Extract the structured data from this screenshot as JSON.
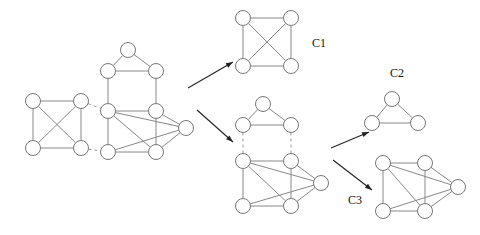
{
  "figure": {
    "title": "",
    "background_color": "#ffffff",
    "node_fill": "#ffffff",
    "node_stroke": "#777777",
    "edge_color": "#888888",
    "dashed_edge_color": "#999999",
    "arrow_color": "#222222",
    "label_color": "#111111",
    "node_radius": 7.5
  },
  "labels": {
    "c1": "C1",
    "c2": "C2",
    "c3": "C3"
  },
  "chart_data": {
    "type": "diagram",
    "graphs": [
      {
        "id": "input-graph",
        "name": "input-graph",
        "nodes": [
          {
            "id": "a1",
            "x": 33,
            "y": 101
          },
          {
            "id": "a2",
            "x": 81,
            "y": 101
          },
          {
            "id": "a3",
            "x": 33,
            "y": 148
          },
          {
            "id": "a4",
            "x": 81,
            "y": 148
          },
          {
            "id": "t1",
            "x": 128,
            "y": 50
          },
          {
            "id": "b1",
            "x": 108,
            "y": 71
          },
          {
            "id": "b2",
            "x": 156,
            "y": 71
          },
          {
            "id": "c1n",
            "x": 108,
            "y": 111
          },
          {
            "id": "c2n",
            "x": 156,
            "y": 111
          },
          {
            "id": "c3n",
            "x": 108,
            "y": 152
          },
          {
            "id": "c4n",
            "x": 156,
            "y": 152
          },
          {
            "id": "c5n",
            "x": 186,
            "y": 128
          }
        ],
        "solid_edges": [
          [
            "a1",
            "a2"
          ],
          [
            "a1",
            "a3"
          ],
          [
            "a2",
            "a4"
          ],
          [
            "a3",
            "a4"
          ],
          [
            "a1",
            "a4"
          ],
          [
            "a2",
            "a3"
          ],
          [
            "t1",
            "b1"
          ],
          [
            "t1",
            "b2"
          ],
          [
            "b1",
            "b2"
          ],
          [
            "b1",
            "c1n"
          ],
          [
            "b2",
            "c2n"
          ],
          [
            "c1n",
            "c2n"
          ],
          [
            "c1n",
            "c3n"
          ],
          [
            "c3n",
            "c4n"
          ],
          [
            "c2n",
            "c4n"
          ],
          [
            "c1n",
            "c5n"
          ],
          [
            "c2n",
            "c5n"
          ],
          [
            "c3n",
            "c5n"
          ],
          [
            "c4n",
            "c5n"
          ],
          [
            "c1n",
            "c4n"
          ]
        ],
        "dashed_edges": [
          [
            "a2",
            "c1n"
          ],
          [
            "a4",
            "c3n"
          ]
        ]
      },
      {
        "id": "cluster-c1",
        "name": "cluster-c1-graph",
        "label": "C1",
        "nodes": [
          {
            "id": "p1",
            "x": 243,
            "y": 18
          },
          {
            "id": "p2",
            "x": 291,
            "y": 18
          },
          {
            "id": "p3",
            "x": 243,
            "y": 66
          },
          {
            "id": "p4",
            "x": 291,
            "y": 66
          }
        ],
        "solid_edges": [
          [
            "p1",
            "p2"
          ],
          [
            "p1",
            "p3"
          ],
          [
            "p2",
            "p4"
          ],
          [
            "p3",
            "p4"
          ],
          [
            "p1",
            "p4"
          ],
          [
            "p2",
            "p3"
          ]
        ],
        "dashed_edges": []
      },
      {
        "id": "intermediate-graph",
        "name": "intermediate-graph",
        "nodes": [
          {
            "id": "m0",
            "x": 263,
            "y": 104
          },
          {
            "id": "m1",
            "x": 243,
            "y": 125
          },
          {
            "id": "m2",
            "x": 291,
            "y": 125
          },
          {
            "id": "m3",
            "x": 243,
            "y": 161
          },
          {
            "id": "m4",
            "x": 291,
            "y": 161
          },
          {
            "id": "m5",
            "x": 243,
            "y": 206
          },
          {
            "id": "m6",
            "x": 291,
            "y": 206
          },
          {
            "id": "m7",
            "x": 321,
            "y": 183
          }
        ],
        "solid_edges": [
          [
            "m0",
            "m1"
          ],
          [
            "m0",
            "m2"
          ],
          [
            "m1",
            "m2"
          ],
          [
            "m3",
            "m4"
          ],
          [
            "m3",
            "m5"
          ],
          [
            "m5",
            "m6"
          ],
          [
            "m4",
            "m6"
          ],
          [
            "m3",
            "m7"
          ],
          [
            "m4",
            "m7"
          ],
          [
            "m5",
            "m7"
          ],
          [
            "m6",
            "m7"
          ],
          [
            "m3",
            "m6"
          ]
        ],
        "dashed_edges": [
          [
            "m1",
            "m3"
          ],
          [
            "m2",
            "m4"
          ]
        ]
      },
      {
        "id": "cluster-c2",
        "name": "cluster-c2-graph",
        "label": "C2",
        "nodes": [
          {
            "id": "q0",
            "x": 392,
            "y": 99
          },
          {
            "id": "q1",
            "x": 372,
            "y": 123
          },
          {
            "id": "q2",
            "x": 418,
            "y": 123
          }
        ],
        "solid_edges": [
          [
            "q0",
            "q1"
          ],
          [
            "q0",
            "q2"
          ],
          [
            "q1",
            "q2"
          ]
        ],
        "dashed_edges": []
      },
      {
        "id": "cluster-c3",
        "name": "cluster-c3-graph",
        "label": "C3",
        "nodes": [
          {
            "id": "r1",
            "x": 383,
            "y": 163
          },
          {
            "id": "r2",
            "x": 425,
            "y": 163
          },
          {
            "id": "r3",
            "x": 383,
            "y": 211
          },
          {
            "id": "r4",
            "x": 425,
            "y": 211
          },
          {
            "id": "r5",
            "x": 458,
            "y": 187
          }
        ],
        "solid_edges": [
          [
            "r1",
            "r2"
          ],
          [
            "r1",
            "r3"
          ],
          [
            "r3",
            "r4"
          ],
          [
            "r2",
            "r4"
          ],
          [
            "r1",
            "r5"
          ],
          [
            "r2",
            "r5"
          ],
          [
            "r3",
            "r5"
          ],
          [
            "r4",
            "r5"
          ],
          [
            "r1",
            "r4"
          ]
        ],
        "dashed_edges": []
      }
    ],
    "arrows": [
      {
        "id": "arrow-to-c1",
        "name": "arrow-input-to-c1",
        "x1": 188,
        "y1": 88,
        "x2": 233,
        "y2": 62
      },
      {
        "id": "arrow-to-intermediate",
        "name": "arrow-input-to-intermediate",
        "x1": 197,
        "y1": 110,
        "x2": 233,
        "y2": 142
      },
      {
        "id": "arrow-to-c2",
        "name": "arrow-intermediate-to-c2",
        "x1": 331,
        "y1": 148,
        "x2": 369,
        "y2": 132
      },
      {
        "id": "arrow-to-c3",
        "name": "arrow-intermediate-to-c3",
        "x1": 333,
        "y1": 160,
        "x2": 372,
        "y2": 190
      }
    ],
    "label_positions": [
      {
        "id": "c1",
        "text": "C1",
        "x": 312,
        "y": 47
      },
      {
        "id": "c2",
        "text": "C2",
        "x": 390,
        "y": 77
      },
      {
        "id": "c3",
        "text": "C3",
        "x": 348,
        "y": 204
      }
    ]
  }
}
